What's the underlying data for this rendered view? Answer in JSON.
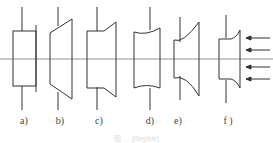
{
  "figure": {
    "type": "technical-diagram",
    "colors": {
      "line": "#333333",
      "axis": "#555555",
      "background": "#ffffff"
    },
    "labels": [
      {
        "id": "a",
        "text": "a)",
        "x": 24
      },
      {
        "id": "b",
        "text": "b)",
        "x": 60
      },
      {
        "id": "c",
        "text": "c)",
        "x": 99
      },
      {
        "id": "d",
        "text": "d)",
        "x": 150
      },
      {
        "id": "e",
        "text": "e)",
        "x": 178
      },
      {
        "id": "f",
        "text": "f )",
        "x": 228
      }
    ],
    "arrows": {
      "count": 4,
      "direction": "left"
    },
    "caption": "图 … (illegible)"
  }
}
